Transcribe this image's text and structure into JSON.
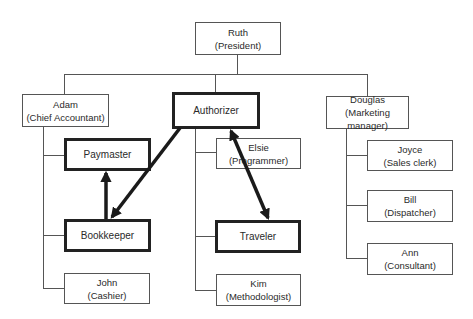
{
  "diagram": {
    "type": "org-chart",
    "colors": {
      "line": "#555555",
      "thick_border": "#222222",
      "arrow": "#1a1a1a",
      "text": "#2a2a2a"
    },
    "nodes": {
      "ruth": {
        "name": "Ruth",
        "role": "(President)"
      },
      "adam": {
        "name": "Adam",
        "role": "(Chief Accountant)"
      },
      "authorizer": {
        "name": "Authorizer",
        "role": ""
      },
      "douglas": {
        "name": "Douglas",
        "role": "(Marketing manager)"
      },
      "paymaster": {
        "name": "Paymaster",
        "role": ""
      },
      "bookkeeper": {
        "name": "Bookkeeper",
        "role": ""
      },
      "john": {
        "name": "John",
        "role": "(Cashier)"
      },
      "elsie": {
        "name": "Elsie",
        "role": "(Programmer)"
      },
      "traveler": {
        "name": "Traveler",
        "role": ""
      },
      "kim": {
        "name": "Kim",
        "role": "(Methodologist)"
      },
      "joyce": {
        "name": "Joyce",
        "role": "(Sales clerk)"
      },
      "bill": {
        "name": "Bill",
        "role": "(Dispatcher)"
      },
      "ann": {
        "name": "Ann",
        "role": "(Consultant)"
      }
    },
    "hierarchy": [
      {
        "parent": "Ruth",
        "children": [
          "Adam",
          "Authorizer",
          "Douglas"
        ]
      },
      {
        "parent": "Adam",
        "children": [
          "Paymaster",
          "Bookkeeper",
          "John"
        ]
      },
      {
        "parent": "Authorizer",
        "children": [
          "Elsie",
          "Traveler",
          "Kim"
        ]
      },
      {
        "parent": "Douglas",
        "children": [
          "Joyce",
          "Bill",
          "Ann"
        ]
      }
    ],
    "arrows": [
      {
        "from": "Authorizer",
        "to": "Bookkeeper",
        "style": "one-way"
      },
      {
        "from": "Bookkeeper",
        "to": "Paymaster",
        "style": "one-way"
      },
      {
        "from": "Authorizer",
        "to": "Traveler",
        "style": "two-way"
      }
    ],
    "highlighted_roles": [
      "Authorizer",
      "Paymaster",
      "Bookkeeper",
      "Traveler"
    ]
  }
}
